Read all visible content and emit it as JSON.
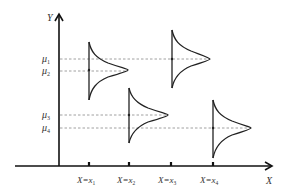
{
  "diagram": {
    "type": "conditional-normal-distributions",
    "axes": {
      "x_label": "X",
      "y_label": "Y"
    },
    "x_ticks": [
      {
        "label_main": "X=x",
        "sub": "1",
        "x": 89
      },
      {
        "label_main": "X=x",
        "sub": "2",
        "x": 129
      },
      {
        "label_main": "X=x",
        "sub": "3",
        "x": 171
      },
      {
        "label_main": "X=x",
        "sub": "4",
        "x": 213
      }
    ],
    "mean_labels": [
      {
        "label": "μ",
        "sub": "1",
        "y": 59
      },
      {
        "label": "μ",
        "sub": "2",
        "y": 71
      },
      {
        "label": "μ",
        "sub": "3",
        "y": 115
      },
      {
        "label": "μ",
        "sub": "4",
        "y": 128
      }
    ],
    "distributions": [
      {
        "at": "x1",
        "mean": "μ2",
        "x": 89,
        "top": 42,
        "bottom": 100,
        "peak_y": 70,
        "peak_x": 128
      },
      {
        "at": "x2",
        "mean": "μ3",
        "x": 129,
        "top": 88,
        "bottom": 143,
        "peak_y": 115,
        "peak_x": 168
      },
      {
        "at": "x3",
        "mean": "μ1",
        "x": 172,
        "top": 30,
        "bottom": 88,
        "peak_y": 59,
        "peak_x": 210
      },
      {
        "at": "x4",
        "mean": "μ4",
        "x": 213,
        "top": 100,
        "bottom": 158,
        "peak_y": 128,
        "peak_x": 251
      }
    ]
  }
}
